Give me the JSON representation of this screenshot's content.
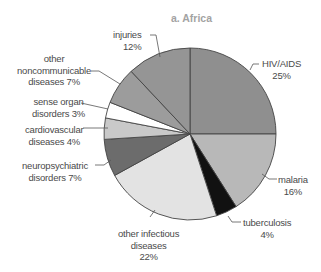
{
  "figure": {
    "title": "a. Africa"
  },
  "chart_data": {
    "type": "pie",
    "title": "a. Africa",
    "start_angle_deg": 0,
    "direction": "clockwise",
    "slices": [
      {
        "label": "HIV/AIDS",
        "value": 25,
        "display": "25%",
        "color": "#8f8f8f"
      },
      {
        "label": "malaria",
        "value": 16,
        "display": "16%",
        "color": "#b8b8b8"
      },
      {
        "label": "tuberculosis",
        "value": 4,
        "display": "4%",
        "color": "#111111"
      },
      {
        "label": "other infectious diseases",
        "value": 22,
        "display": "22%",
        "color": "#e3e3e3"
      },
      {
        "label": "neuropsychiatric disorders",
        "value": 7,
        "display": "7%",
        "color": "#6c6c6c"
      },
      {
        "label": "cardiovascular diseases",
        "value": 4,
        "display": "4%",
        "color": "#c9c9c9"
      },
      {
        "label": "sense organ disorders",
        "value": 3,
        "display": "3%",
        "color": "#ffffff"
      },
      {
        "label": "other noncommunicable diseases",
        "value": 7,
        "display": "7%",
        "color": "#9c9c9c"
      },
      {
        "label": "injuries",
        "value": 12,
        "display": "12%",
        "color": "#959595"
      }
    ],
    "legend": "none (direct labels with leader lines)"
  },
  "labels": {
    "hiv": {
      "line1": "HIV/AIDS",
      "line2": "25%"
    },
    "malaria": {
      "line1": "malaria",
      "line2": "16%"
    },
    "tb": {
      "line1": "tuberculosis",
      "line2": "4%"
    },
    "other_infectious": {
      "line1": "other infectious",
      "line2": "diseases",
      "line3": "22%"
    },
    "neuro": {
      "line1": "neuropsychiatric",
      "line2": "disorders 7%"
    },
    "cardio": {
      "line1": "cardiovascular",
      "line2": "diseases 4%"
    },
    "sense": {
      "line1": "sense organ",
      "line2": "disorders 3%"
    },
    "noncomm": {
      "line1": "other",
      "line2": "noncommunicable",
      "line3": "diseases 7%"
    },
    "injuries": {
      "line1": "injuries",
      "line2": "12%"
    }
  }
}
